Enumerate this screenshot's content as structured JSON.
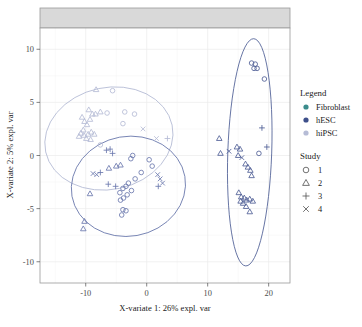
{
  "axes": {
    "x_title": "X-variate 1: 26% expl. var",
    "y_title": "X-variate 2: 5% expl. var",
    "x_ticks": [
      "-10",
      "0",
      "10",
      "20"
    ],
    "y_ticks": [
      "10",
      "5",
      "0",
      "-5",
      "-10"
    ]
  },
  "legend": {
    "group_title": "Legend",
    "group_items": [
      {
        "label": "Fibroblast",
        "color": "#3b8c8c"
      },
      {
        "label": "hESC",
        "color": "#3d4f8a"
      },
      {
        "label": "hiPSC",
        "color": "#b6bcd6"
      }
    ],
    "study_title": "Study",
    "study_items": [
      {
        "label": "1",
        "shape": "circle"
      },
      {
        "label": "2",
        "shape": "triangle"
      },
      {
        "label": "3",
        "shape": "plus"
      },
      {
        "label": "4",
        "shape": "cross"
      }
    ]
  },
  "chart_data": {
    "type": "scatter",
    "title": "",
    "xlabel": "X-variate 1: 26% expl. var",
    "ylabel": "X-variate 2: 5% expl. var",
    "xlim": [
      -17.5,
      23.5
    ],
    "ylim": [
      -12.0,
      12.0
    ],
    "grid": true,
    "legend_position": "right",
    "facet_strip": true,
    "colors": {
      "Fibroblast": "#3b8c8c",
      "hESC": "#3d4f8a",
      "hiPSC": "#b6bcd6"
    },
    "shapes": {
      "1": "circle",
      "2": "triangle",
      "3": "plus",
      "4": "cross"
    },
    "ellipses": [
      {
        "group": "hiPSC",
        "cx": -6.2,
        "cy": 1.6,
        "rx": 10.6,
        "ry": 4.8,
        "angle": -12,
        "color": "#b6bcd6"
      },
      {
        "group": "hESC",
        "cx": -3.0,
        "cy": -2.9,
        "rx": 9.4,
        "ry": 4.7,
        "angle": -10,
        "color": "#6b79ad"
      },
      {
        "group": "Fibroblast",
        "cx": 16.9,
        "cy": 0.3,
        "rx": 3.6,
        "ry": 10.7,
        "angle": 2,
        "color": "#4f5f96"
      }
    ],
    "series": [
      {
        "name": "hiPSC",
        "color": "#b6bcd6",
        "points": [
          {
            "x": -8.3,
            "y": 6.2,
            "study": "2"
          },
          {
            "x": -9.5,
            "y": 4.3,
            "study": "2"
          },
          {
            "x": -8.9,
            "y": 3.9,
            "study": "2"
          },
          {
            "x": -8.4,
            "y": 3.9,
            "study": "2"
          },
          {
            "x": -7.6,
            "y": 4.1,
            "study": "2"
          },
          {
            "x": -9.3,
            "y": 3.4,
            "study": "2"
          },
          {
            "x": -10.2,
            "y": 3.2,
            "study": "2"
          },
          {
            "x": -9.8,
            "y": 2.9,
            "study": "2"
          },
          {
            "x": -10.4,
            "y": 2.4,
            "study": "2"
          },
          {
            "x": -10.8,
            "y": 2.1,
            "study": "2"
          },
          {
            "x": -10.3,
            "y": 1.9,
            "study": "2"
          },
          {
            "x": -9.6,
            "y": 2.0,
            "study": "2"
          },
          {
            "x": -9.1,
            "y": 2.2,
            "study": "2"
          },
          {
            "x": -8.6,
            "y": 2.0,
            "study": "2"
          },
          {
            "x": -11.1,
            "y": 1.8,
            "study": "2"
          },
          {
            "x": -9.9,
            "y": 1.6,
            "study": "2"
          },
          {
            "x": -9.2,
            "y": 1.5,
            "study": "2"
          },
          {
            "x": -10.6,
            "y": 3.6,
            "study": "2"
          },
          {
            "x": -5.6,
            "y": 6.1,
            "study": "1"
          },
          {
            "x": -3.6,
            "y": 4.1,
            "study": "1"
          },
          {
            "x": -2.0,
            "y": 3.9,
            "study": "1"
          },
          {
            "x": -3.9,
            "y": 3.0,
            "study": "1"
          },
          {
            "x": -6.5,
            "y": 4.0,
            "study": "1"
          },
          {
            "x": -7.6,
            "y": 1.0,
            "study": "1"
          },
          {
            "x": -0.6,
            "y": 2.5,
            "study": "4"
          },
          {
            "x": 1.6,
            "y": 1.6,
            "study": "4"
          },
          {
            "x": 3.4,
            "y": 1.6,
            "study": "3"
          }
        ]
      },
      {
        "name": "hESC",
        "color": "#6b79ad",
        "points": [
          {
            "x": -6.6,
            "y": 0.5,
            "study": "3"
          },
          {
            "x": -6.0,
            "y": 0.6,
            "study": "3"
          },
          {
            "x": -5.6,
            "y": 0.2,
            "study": "3"
          },
          {
            "x": -7.6,
            "y": -1.6,
            "study": "3"
          },
          {
            "x": -5.1,
            "y": -2.9,
            "study": "3"
          },
          {
            "x": -6.3,
            "y": -2.7,
            "study": "3"
          },
          {
            "x": -8.8,
            "y": -1.7,
            "study": "4"
          },
          {
            "x": -8.2,
            "y": -1.8,
            "study": "4"
          },
          {
            "x": -9.3,
            "y": -3.6,
            "study": "2"
          },
          {
            "x": -10.2,
            "y": -6.2,
            "study": "2"
          },
          {
            "x": -10.4,
            "y": -6.9,
            "study": "2"
          },
          {
            "x": -5.0,
            "y": -1.0,
            "study": "2"
          },
          {
            "x": -4.3,
            "y": -0.9,
            "study": "2"
          },
          {
            "x": -6.2,
            "y": -1.2,
            "study": "2"
          },
          {
            "x": -3.0,
            "y": -2.6,
            "study": "1"
          },
          {
            "x": -3.4,
            "y": -2.9,
            "study": "1"
          },
          {
            "x": -3.9,
            "y": -3.1,
            "study": "1"
          },
          {
            "x": -4.4,
            "y": -3.5,
            "study": "1"
          },
          {
            "x": -3.2,
            "y": -3.7,
            "study": "1"
          },
          {
            "x": -3.8,
            "y": -4.0,
            "study": "1"
          },
          {
            "x": -4.3,
            "y": -4.2,
            "study": "1"
          },
          {
            "x": -2.5,
            "y": -3.3,
            "study": "1"
          },
          {
            "x": -1.9,
            "y": -2.2,
            "study": "1"
          },
          {
            "x": -0.9,
            "y": -1.6,
            "study": "1"
          },
          {
            "x": -3.9,
            "y": -5.1,
            "study": "1"
          },
          {
            "x": -3.4,
            "y": -5.2,
            "study": "1"
          },
          {
            "x": -4.1,
            "y": -5.6,
            "study": "1"
          },
          {
            "x": -2.6,
            "y": -0.3,
            "study": "1"
          },
          {
            "x": -2.3,
            "y": 0.0,
            "study": "1"
          },
          {
            "x": 1.8,
            "y": -1.8,
            "study": "4"
          },
          {
            "x": 2.2,
            "y": -2.2,
            "study": "4"
          },
          {
            "x": 2.6,
            "y": -2.6,
            "study": "4"
          },
          {
            "x": 1.9,
            "y": -2.9,
            "study": "3"
          },
          {
            "x": 0.9,
            "y": -1.0,
            "study": "1"
          },
          {
            "x": 0.4,
            "y": -0.4,
            "study": "1"
          }
        ]
      },
      {
        "name": "Fibroblast",
        "color": "#4f5f96",
        "points": [
          {
            "x": 17.2,
            "y": 8.7,
            "study": "1"
          },
          {
            "x": 17.8,
            "y": 8.6,
            "study": "1"
          },
          {
            "x": 17.6,
            "y": 8.2,
            "study": "1"
          },
          {
            "x": 18.1,
            "y": 8.2,
            "study": "1"
          },
          {
            "x": 19.3,
            "y": 7.2,
            "study": "1"
          },
          {
            "x": 18.9,
            "y": 2.6,
            "study": "3"
          },
          {
            "x": 19.7,
            "y": 0.8,
            "study": "3"
          },
          {
            "x": 11.9,
            "y": 1.6,
            "study": "2"
          },
          {
            "x": 12.1,
            "y": 0.2,
            "study": "2"
          },
          {
            "x": 13.5,
            "y": 0.4,
            "study": "4"
          },
          {
            "x": 14.8,
            "y": 0.8,
            "study": "2"
          },
          {
            "x": 15.3,
            "y": 0.6,
            "study": "2"
          },
          {
            "x": 15.0,
            "y": 0.0,
            "study": "2"
          },
          {
            "x": 15.6,
            "y": -0.2,
            "study": "4"
          },
          {
            "x": 16.2,
            "y": -0.8,
            "study": "2"
          },
          {
            "x": 16.6,
            "y": -1.1,
            "study": "2"
          },
          {
            "x": 17.0,
            "y": -1.4,
            "study": "2"
          },
          {
            "x": 17.2,
            "y": -1.9,
            "study": "2"
          },
          {
            "x": 18.4,
            "y": 0.2,
            "study": "1"
          },
          {
            "x": 15.1,
            "y": -3.5,
            "study": "2"
          },
          {
            "x": 15.5,
            "y": -3.9,
            "study": "2"
          },
          {
            "x": 16.0,
            "y": -4.0,
            "study": "2"
          },
          {
            "x": 16.4,
            "y": -4.2,
            "study": "2"
          },
          {
            "x": 16.9,
            "y": -4.1,
            "study": "2"
          },
          {
            "x": 17.4,
            "y": -4.3,
            "study": "2"
          },
          {
            "x": 15.8,
            "y": -4.5,
            "study": "2"
          },
          {
            "x": 16.3,
            "y": -4.8,
            "study": "2"
          },
          {
            "x": 16.9,
            "y": -5.3,
            "study": "2"
          },
          {
            "x": 15.4,
            "y": -4.3,
            "study": "2"
          }
        ]
      }
    ]
  }
}
